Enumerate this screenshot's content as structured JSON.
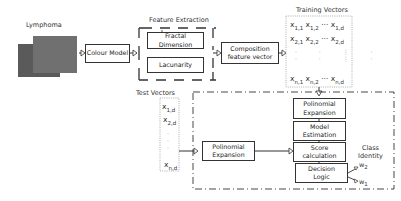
{
  "input": {
    "label": "Lymphoma"
  },
  "colour_model": {
    "label": "Colour Model"
  },
  "feature_extraction": {
    "title": "Feature Extraction",
    "items": [
      "Fractal Dimension",
      "Lacunarity"
    ]
  },
  "composition": {
    "line1": "Composition",
    "line2": "feature vector"
  },
  "training_vectors": {
    "title": "Training Vectors",
    "rows": [
      [
        "x",
        "1,1",
        "x",
        "1,2",
        "···",
        "x",
        "1,d"
      ],
      [
        "x",
        "2,1",
        "x",
        "2,2",
        "···",
        "x",
        "2,d"
      ],
      [
        "x",
        "n,1",
        "x",
        "n,2",
        "···",
        "x",
        "n,d"
      ]
    ]
  },
  "test_vectors": {
    "title": "Test Vectors",
    "items": [
      {
        "base": "x",
        "sub": "1,d"
      },
      {
        "base": "x",
        "sub": "2,d"
      },
      {
        "base": "x",
        "sub": "n,d"
      }
    ]
  },
  "classifier": {
    "train_poly": {
      "line1": "Polinomial",
      "line2": "Expansion"
    },
    "model_estimation": {
      "line1": "Model",
      "line2": "Estimation"
    },
    "score": {
      "line1": "Score",
      "line2": "calculation"
    },
    "decision": {
      "line1": "Decision",
      "line2": "Logic"
    },
    "test_poly": {
      "line1": "Polinomial",
      "line2": "Expansion"
    },
    "class_identity": {
      "line1": "Class",
      "line2": "Identity"
    },
    "outputs": [
      {
        "base": "w",
        "sub": "2"
      },
      {
        "base": "w",
        "sub": "1"
      }
    ]
  }
}
